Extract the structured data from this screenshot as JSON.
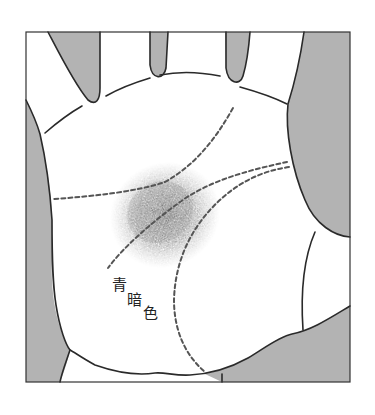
{
  "diagram": {
    "type": "palmistry-illustration",
    "colors": {
      "frame": "#333333",
      "outline": "#2a2a2a",
      "background_fill": "#b0b0b0",
      "palm_fill": "#ffffff",
      "shading": "#6e6e6e",
      "dashed_line": "#555555"
    },
    "annotation": {
      "chars": [
        "青",
        "暗",
        "色"
      ],
      "text": "青暗色"
    }
  }
}
